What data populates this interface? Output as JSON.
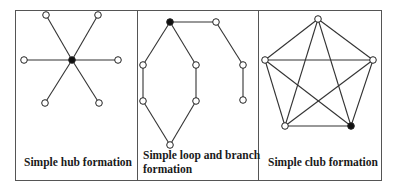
{
  "figure": {
    "panels": [
      {
        "id": "hub",
        "caption": "Simple hub formation",
        "nodes": [
          {
            "x": 72,
            "y": 60,
            "filled": true
          },
          {
            "x": 46,
            "y": 15,
            "filled": false
          },
          {
            "x": 98,
            "y": 15,
            "filled": false
          },
          {
            "x": 24,
            "y": 60,
            "filled": false
          },
          {
            "x": 118,
            "y": 60,
            "filled": false
          },
          {
            "x": 45,
            "y": 103,
            "filled": false
          },
          {
            "x": 99,
            "y": 103,
            "filled": false
          }
        ],
        "edges": [
          [
            0,
            1
          ],
          [
            0,
            2
          ],
          [
            0,
            3
          ],
          [
            0,
            4
          ],
          [
            0,
            5
          ],
          [
            0,
            6
          ]
        ]
      },
      {
        "id": "loop-branch",
        "caption_line1": "Simple loop and branch",
        "caption_line2": "formation",
        "nodes": [
          {
            "x": 170,
            "y": 22,
            "filled": true
          },
          {
            "x": 143,
            "y": 65,
            "filled": false
          },
          {
            "x": 196,
            "y": 65,
            "filled": false
          },
          {
            "x": 143,
            "y": 101,
            "filled": false
          },
          {
            "x": 196,
            "y": 101,
            "filled": false
          },
          {
            "x": 170,
            "y": 145,
            "filled": false
          },
          {
            "x": 216,
            "y": 22,
            "filled": false
          },
          {
            "x": 243,
            "y": 65,
            "filled": false
          },
          {
            "x": 243,
            "y": 100,
            "filled": false
          }
        ],
        "edges": [
          [
            0,
            1
          ],
          [
            0,
            2
          ],
          [
            1,
            3
          ],
          [
            2,
            4
          ],
          [
            3,
            5
          ],
          [
            4,
            5
          ],
          [
            0,
            6
          ],
          [
            6,
            7
          ],
          [
            7,
            8
          ]
        ]
      },
      {
        "id": "club",
        "caption": "Simple club formation",
        "nodes": [
          {
            "x": 318,
            "y": 19,
            "filled": false
          },
          {
            "x": 265,
            "y": 60,
            "filled": false
          },
          {
            "x": 373,
            "y": 60,
            "filled": false
          },
          {
            "x": 285,
            "y": 126,
            "filled": false
          },
          {
            "x": 351,
            "y": 126,
            "filled": true
          }
        ],
        "edges": [
          [
            0,
            1
          ],
          [
            0,
            2
          ],
          [
            0,
            3
          ],
          [
            0,
            4
          ],
          [
            1,
            2
          ],
          [
            1,
            3
          ],
          [
            1,
            4
          ],
          [
            2,
            3
          ],
          [
            2,
            4
          ],
          [
            3,
            4
          ]
        ]
      }
    ]
  }
}
